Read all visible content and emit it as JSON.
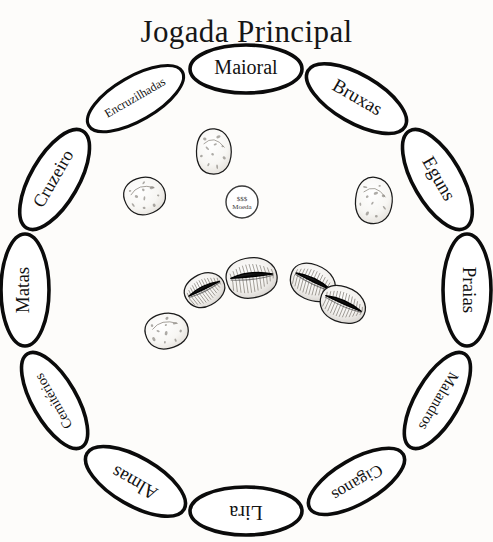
{
  "page": {
    "title": "Jogada Principal",
    "background_color": "#fdfcfa",
    "ink_color": "#111111"
  },
  "board": {
    "name": "divination-board",
    "shape": "ring-of-ellipses",
    "center": {
      "x": 246,
      "y": 290
    },
    "radius": 221,
    "segment_count": 12,
    "segments": [
      {
        "index": 0,
        "label": "Maioral",
        "angle_deg": 0,
        "emphasis": "large",
        "text_size": 20
      },
      {
        "index": 1,
        "label": "Bruxas",
        "angle_deg": 30,
        "emphasis": "large",
        "text_size": 19
      },
      {
        "index": 2,
        "label": "Eguns",
        "angle_deg": 60,
        "emphasis": "large",
        "text_size": 19
      },
      {
        "index": 3,
        "label": "Praias",
        "angle_deg": 90,
        "emphasis": "large",
        "text_size": 19
      },
      {
        "index": 4,
        "label": "Malandros",
        "angle_deg": 120,
        "emphasis": "medium",
        "text_size": 15
      },
      {
        "index": 5,
        "label": "Ciganos",
        "angle_deg": 150,
        "emphasis": "medium",
        "text_size": 17
      },
      {
        "index": 6,
        "label": "Lira",
        "angle_deg": 180,
        "emphasis": "large",
        "text_size": 20
      },
      {
        "index": 7,
        "label": "Almas",
        "angle_deg": 210,
        "emphasis": "large",
        "text_size": 19
      },
      {
        "index": 8,
        "label": "Cemitérios",
        "angle_deg": 240,
        "emphasis": "medium",
        "text_size": 14
      },
      {
        "index": 9,
        "label": "Matas",
        "angle_deg": 270,
        "emphasis": "large",
        "text_size": 19
      },
      {
        "index": 10,
        "label": "Cruzeiro",
        "angle_deg": 300,
        "emphasis": "large",
        "text_size": 18
      },
      {
        "index": 11,
        "label": "Encruzilhadas",
        "angle_deg": 330,
        "emphasis": "small",
        "text_size": 12
      }
    ]
  },
  "coin": {
    "name": "moeda-token",
    "symbol": "$$$",
    "label": "Moeda",
    "x": 242,
    "y": 202,
    "radius": 16
  },
  "shells": {
    "open_count": 4,
    "closed_count": 4,
    "total": 8,
    "open": [
      {
        "id": "open-1",
        "x": 205,
        "y": 290,
        "w": 42,
        "h": 33,
        "rot": -32
      },
      {
        "id": "open-2",
        "x": 252,
        "y": 278,
        "w": 52,
        "h": 41,
        "rot": -12
      },
      {
        "id": "open-3",
        "x": 313,
        "y": 283,
        "w": 48,
        "h": 36,
        "rot": 20
      },
      {
        "id": "open-4",
        "x": 343,
        "y": 305,
        "w": 48,
        "h": 36,
        "rot": 18
      }
    ],
    "closed": [
      {
        "id": "closed-1",
        "x": 145,
        "y": 196,
        "w": 42,
        "h": 38,
        "rot": -20
      },
      {
        "id": "closed-2",
        "x": 214,
        "y": 152,
        "w": 36,
        "h": 46,
        "rot": 6
      },
      {
        "id": "closed-3",
        "x": 374,
        "y": 201,
        "w": 38,
        "h": 47,
        "rot": 10
      },
      {
        "id": "closed-4",
        "x": 167,
        "y": 331,
        "w": 44,
        "h": 36,
        "rot": -16
      }
    ]
  }
}
